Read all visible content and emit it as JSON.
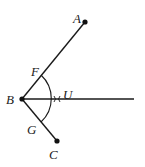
{
  "diagram": {
    "type": "geometry-angle-bisector-construction",
    "colors": {
      "stroke": "#1a1a1a",
      "background": "#ffffff"
    },
    "points": [
      {
        "id": "A",
        "label": "A",
        "x": 85,
        "y": 22,
        "dot": true,
        "label_x": 73,
        "label_y": 23
      },
      {
        "id": "B",
        "label": "B",
        "x": 22,
        "y": 99,
        "dot": true,
        "label_x": 6,
        "label_y": 104
      },
      {
        "id": "C",
        "label": "C",
        "x": 57,
        "y": 141,
        "dot": true,
        "label_x": 49,
        "label_y": 159
      },
      {
        "id": "F",
        "label": "F",
        "x": 41,
        "y": 75,
        "dot": false,
        "label_x": 31,
        "label_y": 76
      },
      {
        "id": "G",
        "label": "G",
        "x": 41,
        "y": 122,
        "dot": false,
        "label_x": 27,
        "label_y": 134
      },
      {
        "id": "U",
        "label": "U",
        "x": 58,
        "y": 99,
        "dot": false,
        "label_x": 63,
        "label_y": 99
      }
    ],
    "segments": [
      {
        "from": "B",
        "to": "A"
      },
      {
        "from": "B",
        "to": "C"
      }
    ],
    "ray": {
      "from": "B",
      "to_x": 134,
      "to_y": 99
    },
    "arc": {
      "center": "B",
      "radius": 32,
      "from": "F",
      "to": "G"
    }
  }
}
